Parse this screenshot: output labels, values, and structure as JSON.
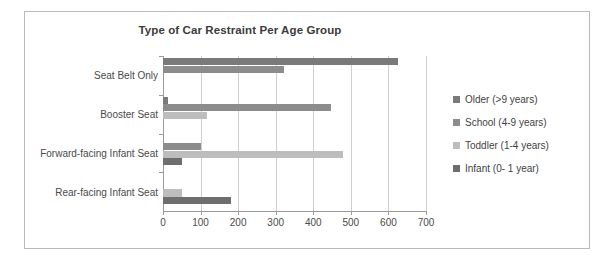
{
  "chart_data": {
    "type": "bar",
    "orientation": "horizontal",
    "title": "Type of Car Restraint Per Age Group",
    "xlabel": "",
    "ylabel": "",
    "xlim": [
      0,
      700
    ],
    "xticks": [
      0,
      100,
      200,
      300,
      400,
      500,
      600,
      700
    ],
    "grid": true,
    "legend_position": "right",
    "categories": [
      "Seat Belt Only",
      "Booster Seat",
      "Forward-facing Infant Seat",
      "Rear-facing Infant Seat"
    ],
    "series": [
      {
        "name": "Older (>9 years)",
        "color": "#7a7a7a",
        "values": [
          625,
          12,
          0,
          0
        ]
      },
      {
        "name": "School (4-9 years)",
        "color": "#8c8c8c",
        "values": [
          322,
          448,
          100,
          0
        ]
      },
      {
        "name": "Toddler (1-4 years)",
        "color": "#bdbdbd",
        "values": [
          0,
          118,
          480,
          50
        ]
      },
      {
        "name": "Infant (0- 1 year)",
        "color": "#6e6e6e",
        "values": [
          0,
          0,
          50,
          180
        ]
      }
    ]
  },
  "colors": {
    "frame_border": "#b9b9b9",
    "gridline": "#cfcfcf",
    "axis": "#9a9a9a",
    "text": "#4a4a4a",
    "title_text": "#3b3b3b"
  }
}
